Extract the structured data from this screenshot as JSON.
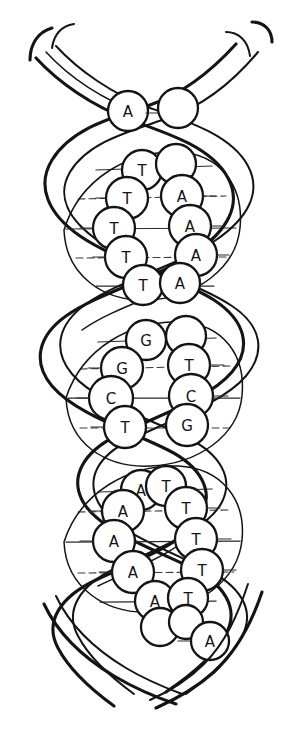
{
  "figure": {
    "ink_color": "#141414",
    "background_color": "#ffffff",
    "canvas": {
      "width": 303,
      "height": 753
    }
  },
  "strands": {
    "count": 2,
    "turns": 3,
    "label_left": "",
    "label_right": ""
  },
  "bases": {
    "top_solo": {
      "letter": "A",
      "cx": 128,
      "cy": 111,
      "r": 20
    },
    "bottom_solo": {
      "letter": "A",
      "cx": 210,
      "cy": 641,
      "r": 19
    },
    "top_partial": {
      "letter": "",
      "cx": 178,
      "cy": 108,
      "r": 20
    },
    "sections": [
      {
        "name": "section-1",
        "left_letters": [
          "T",
          "T",
          "T",
          "T",
          "T"
        ],
        "right_letters": [
          "",
          "A",
          "A",
          "A",
          "A"
        ],
        "pairs": [
          {
            "left": "T",
            "right": "",
            "y": 170,
            "lx": 142,
            "rx": 176
          },
          {
            "left": "T",
            "right": "A",
            "y": 198,
            "lx": 127,
            "rx": 182
          },
          {
            "left": "T",
            "right": "A",
            "y": 228,
            "lx": 114,
            "rx": 190
          },
          {
            "left": "T",
            "right": "A",
            "y": 257,
            "lx": 126,
            "rx": 196
          },
          {
            "left": "T",
            "right": "A",
            "y": 285,
            "lx": 143,
            "rx": 180
          }
        ]
      },
      {
        "name": "section-2",
        "left_letters": [
          "G",
          "G",
          "C",
          "T"
        ],
        "right_letters": [
          "",
          "T",
          "C",
          "G"
        ],
        "pairs": [
          {
            "left": "G",
            "right": "",
            "y": 342,
            "lx": 146,
            "rx": 186
          },
          {
            "left": "G",
            "right": "T",
            "y": 368,
            "lx": 122,
            "rx": 189
          },
          {
            "left": "C",
            "right": "C",
            "y": 398,
            "lx": 111,
            "rx": 191
          },
          {
            "left": "T",
            "right": "G",
            "y": 427,
            "lx": 125,
            "rx": 187
          }
        ]
      },
      {
        "name": "section-3",
        "left_letters": [
          "A",
          "A",
          "A",
          "A",
          "A"
        ],
        "right_letters": [
          "T",
          "T",
          "T",
          "T",
          "T"
        ],
        "pairs": [
          {
            "left": "A",
            "right": "T",
            "y": 492,
            "lx": 141,
            "rx": 166
          },
          {
            "left": "A",
            "right": "T",
            "y": 511,
            "lx": 123,
            "rx": 186
          },
          {
            "left": "A",
            "right": "T",
            "y": 541,
            "lx": 114,
            "rx": 196
          },
          {
            "left": "A",
            "right": "T",
            "y": 572,
            "lx": 133,
            "rx": 202
          },
          {
            "left": "A",
            "right": "T",
            "y": 601,
            "lx": 155,
            "rx": 188
          }
        ]
      }
    ]
  },
  "sequence": {
    "left_strand_top_to_bottom": [
      "A",
      "T",
      "T",
      "T",
      "T",
      "T",
      "G",
      "G",
      "C",
      "T",
      "A",
      "A",
      "A",
      "A",
      "A"
    ],
    "right_strand_top_to_bottom": [
      "",
      "",
      "A",
      "A",
      "A",
      "A",
      "",
      "T",
      "C",
      "G",
      "T",
      "T",
      "T",
      "T",
      "T",
      "A"
    ]
  }
}
